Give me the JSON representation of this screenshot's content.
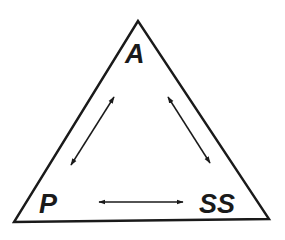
{
  "diagram": {
    "type": "triangle-relationship",
    "stroke_color": "#1a1a1a",
    "background_color": "#ffffff",
    "vertices": {
      "top": {
        "label": "A"
      },
      "bottom_left": {
        "label": "P"
      },
      "bottom_right": {
        "label": "SS"
      }
    },
    "edges": [
      {
        "from": "A",
        "to": "P",
        "type": "double-arrow"
      },
      {
        "from": "A",
        "to": "SS",
        "type": "double-arrow"
      },
      {
        "from": "P",
        "to": "SS",
        "type": "double-arrow"
      }
    ]
  }
}
